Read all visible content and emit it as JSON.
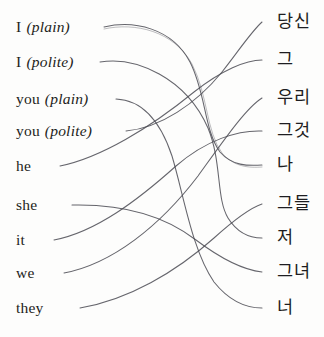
{
  "diagram": {
    "background_color": "#fdfdfc",
    "stroke_color": "#4a4a52",
    "text_color": "#1d1d21"
  },
  "left_column": {
    "heading": "",
    "items": [
      {
        "base": "I",
        "qualifier": "(plain)",
        "y": 27
      },
      {
        "base": "I",
        "qualifier": "(polite)",
        "y": 62
      },
      {
        "base": "you",
        "qualifier": "(plain)",
        "y": 99
      },
      {
        "base": "you",
        "qualifier": "(polite)",
        "y": 131
      },
      {
        "base": "he",
        "qualifier": "",
        "y": 166
      },
      {
        "base": "she",
        "qualifier": "",
        "y": 205
      },
      {
        "base": "it",
        "qualifier": "",
        "y": 240
      },
      {
        "base": "we",
        "qualifier": "",
        "y": 273
      },
      {
        "base": "they",
        "qualifier": "",
        "y": 308
      }
    ]
  },
  "right_column": {
    "heading": "",
    "items": [
      {
        "label": "당신",
        "y": 22
      },
      {
        "label": "그",
        "y": 60
      },
      {
        "label": "우리",
        "y": 98
      },
      {
        "label": "그것",
        "y": 131
      },
      {
        "label": "나",
        "y": 165
      },
      {
        "label": "그들",
        "y": 204
      },
      {
        "label": "저",
        "y": 238
      },
      {
        "label": "그녀",
        "y": 272
      },
      {
        "label": "너",
        "y": 308
      }
    ]
  },
  "connections": [
    {
      "name": "i-plain-to-na",
      "from": "I (plain)",
      "to": "나",
      "doubled": true,
      "path": "M 104 27 C 134 20, 172 28, 190 62 C 206 93, 204 130, 220 152 C 232 166, 248 166, 262 165",
      "path_shadow": "M 104 29 C 135 22, 174 31, 192 64 C 208 95, 206 131, 222 153 C 234 167, 249 168, 262 167"
    },
    {
      "name": "i-polite-to-jeo",
      "from": "I (polite)",
      "to": "저",
      "doubled": false,
      "path": "M 100 62 C 136 56, 186 78, 208 128 C 222 162, 216 198, 228 218 C 238 234, 250 238, 262 238"
    },
    {
      "name": "you-plain-to-neo",
      "from": "you (plain)",
      "to": "너",
      "doubled": false,
      "path": "M 116 99 C 142 100, 160 120, 172 156 C 184 196, 192 250, 214 282 C 230 302, 248 308, 262 308"
    },
    {
      "name": "you-polite-to-dangsin",
      "from": "you (polite)",
      "to": "당신",
      "doubled": false,
      "path": "M 126 131 C 160 128, 196 104, 222 72 C 238 52, 250 33, 262 22"
    },
    {
      "name": "he-to-geu",
      "from": "he",
      "to": "그",
      "doubled": false,
      "path": "M 60 166 C 100 158, 150 128, 194 92 C 222 70, 246 60, 262 60"
    },
    {
      "name": "she-to-geunyeo",
      "from": "she",
      "to": "그녀",
      "doubled": false,
      "path": "M 72 205 C 116 204, 160 212, 196 240 C 220 258, 244 270, 262 272"
    },
    {
      "name": "it-to-geugeot",
      "from": "it",
      "to": "그것",
      "doubled": false,
      "path": "M 54 240 C 96 232, 138 200, 176 166 C 206 140, 238 130, 262 131"
    },
    {
      "name": "we-to-uri",
      "from": "we",
      "to": "우리",
      "doubled": false,
      "path": "M 64 273 C 112 264, 160 226, 198 176 C 224 140, 246 108, 262 98"
    },
    {
      "name": "they-to-geudeul",
      "from": "they",
      "to": "그들",
      "doubled": false,
      "path": "M 80 308 C 128 300, 176 272, 214 238 C 234 220, 250 208, 262 204"
    }
  ]
}
